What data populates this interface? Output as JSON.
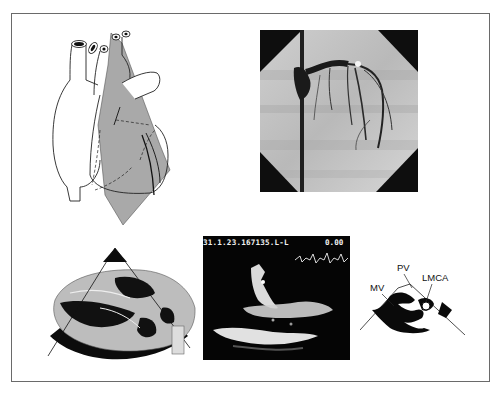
{
  "figure": {
    "panels": [
      {
        "id": "heart-diagram",
        "description": "Line drawing of heart with shaded gray imaging plane"
      },
      {
        "id": "coronary-angiogram",
        "description": "Grayscale X-ray coronary angiogram"
      },
      {
        "id": "heart-specimen",
        "description": "Anatomic heart specimen section with sector overlay"
      },
      {
        "id": "echocardiogram",
        "description": "Black-background ultrasound image with header text"
      },
      {
        "id": "schematic-diagram",
        "description": "Labeled schematic of echo plane"
      }
    ]
  },
  "echo": {
    "header_text": "31.1.23.167135.L-L",
    "depth_value": "0.00"
  },
  "schematic": {
    "labels": {
      "pv": "PV",
      "lmca": "LMCA",
      "mv": "MV"
    }
  },
  "colors": {
    "frame": "#6a6a6a",
    "plane_gray": "#a9a9a9",
    "ink": "#111111",
    "echo_bg": "#050505"
  }
}
